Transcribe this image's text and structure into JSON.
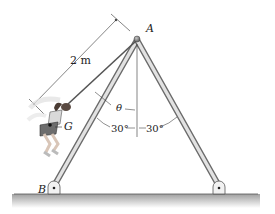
{
  "figure": {
    "labels": {
      "apex": "A",
      "base": "B",
      "center_of_gravity": "G",
      "rope_length": "2 m",
      "swing_angle": "θ",
      "left_leg_angle": "30°",
      "right_leg_angle": "30°"
    },
    "colors": {
      "leg_fill": "#d9d9d9",
      "leg_edge": "#6b6b6b",
      "rope": "#555555",
      "ground_shadow": "#9a9a9a",
      "line": "#333333"
    }
  }
}
